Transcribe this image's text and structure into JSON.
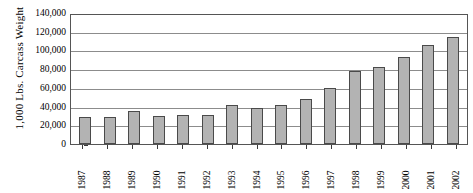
{
  "chart_data": {
    "type": "bar",
    "title": "",
    "xlabel": "",
    "ylabel": "1,000 Lbs. Carcass Weight",
    "categories": [
      "1987",
      "1988",
      "1989",
      "1990",
      "1991",
      "1992",
      "1993",
      "1994",
      "1995",
      "1996",
      "1997",
      "1998",
      "1999",
      "2000",
      "2001",
      "2002"
    ],
    "values": [
      28500,
      29000,
      35000,
      29500,
      30500,
      30500,
      41500,
      38500,
      42000,
      48500,
      59500,
      77500,
      82000,
      93000,
      106000,
      114000
    ],
    "ylim": [
      0,
      140000
    ],
    "ytick_step": 20000,
    "ytick_labels": [
      "140,000",
      "120,000",
      "100,000",
      "80,000",
      "60,000",
      "40,000",
      "20,000",
      "0"
    ],
    "ytick_values": [
      140000,
      120000,
      100000,
      80000,
      60000,
      40000,
      20000,
      0
    ],
    "grid": true,
    "legend": "none",
    "bar_color": "#b3b3b3",
    "bar_border_color": "#4a4a4a",
    "gridline_color": "#8c8c8c",
    "axis_color": "#555555"
  }
}
